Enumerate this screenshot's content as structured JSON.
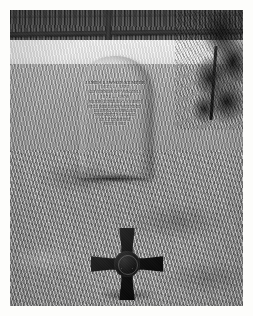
{
  "photograph": {
    "caption": "Grave of James Lawson Kemper with Southern Cross of Honor marker",
    "medium": "black-and-white photographic print with white border",
    "border_color": "#fdfdfb"
  },
  "scene": {
    "treeline_label": "distant dark treeline",
    "fence_label": "wooden post-and-rail fence",
    "light_band_label": "sunlit grass band",
    "midground_label": "midground grass",
    "foreground_label": "foreground grass",
    "evergreen_label": "evergreen tree",
    "ground_shadow_label": "ground shadow"
  },
  "gravestone": {
    "shape": "round-topped marble headstone",
    "stone_color": "#a8a598",
    "inscription": [
      {
        "id": "name",
        "text": "JAMES LAWSON KEMPER",
        "style": "name"
      },
      {
        "id": "life",
        "text": "1823 — 1895",
        "style": "dates"
      },
      {
        "id": "office",
        "text": "GOVERNOR OF VIRGINIA",
        "style": "office"
      },
      {
        "id": "term",
        "text": "1874 — 1878",
        "style": "dates"
      },
      {
        "id": "rank",
        "text": "MAJOR GENERAL C. S. ARMY",
        "style": "small"
      },
      {
        "id": "wound",
        "text": "FELL SERIOUSLY WOUNDED",
        "style": "small"
      },
      {
        "id": "place",
        "text": "LEADING HIS BRIGADE",
        "style": "small"
      },
      {
        "id": "charge",
        "text": "IN PICKETT'S CHARGE",
        "style": "small"
      },
      {
        "id": "battle",
        "text": "AT GETTYSBURG",
        "style": "small"
      },
      {
        "id": "date",
        "text": "JULY 3, 1863",
        "style": "small"
      }
    ]
  },
  "cross_marker": {
    "name": "Southern Cross of Honor",
    "material": "cast iron",
    "color": "#15150f",
    "center_emblem": "battle flag within laurel wreath"
  }
}
